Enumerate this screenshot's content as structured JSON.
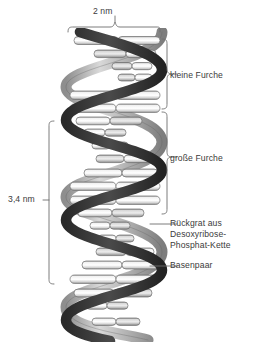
{
  "figure": {
    "language": "de",
    "width_px": 257,
    "height_px": 354,
    "background_color": "#ffffff",
    "text_color": "#3b3b3b",
    "line_color": "#6e6e6e"
  },
  "measurements": {
    "width_label": "2 nm",
    "pitch_label": "3,4 nm"
  },
  "grooves": [
    {
      "key": "minor",
      "label": "kleine Furche"
    },
    {
      "key": "major",
      "label": "große Furche"
    }
  ],
  "callouts": [
    {
      "key": "backbone",
      "lines": [
        "Rückgrat aus",
        "Desoxyribose-",
        "Phosphat-Kette"
      ]
    },
    {
      "key": "basepair",
      "lines": [
        "Basenpaar"
      ]
    }
  ],
  "helix": {
    "strand_front_color": "#3c3c3c",
    "strand_back_color": "#b9b9b9",
    "basepair_color": "#e9e9e9",
    "outline_color": "#5a5a5a",
    "turns": 6,
    "period_px": 55,
    "body_left_px": 66,
    "body_right_px": 162,
    "body_top_px": 32,
    "body_bottom_px": 337,
    "basepair_count": 22
  }
}
